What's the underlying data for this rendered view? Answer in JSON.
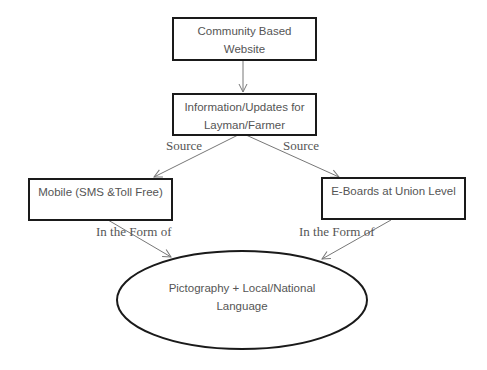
{
  "nodes": {
    "website": {
      "line1": "Community Based",
      "line2": "Website"
    },
    "info": {
      "line1": "Information/Updates for",
      "line2": "Layman/Farmer"
    },
    "mobile": {
      "line1": "Mobile (SMS &Toll Free)"
    },
    "eboards": {
      "line1": "E-Boards at Union Level"
    },
    "pictography": {
      "line1": "Pictography + Local/National",
      "line2": "Language"
    }
  },
  "edges": {
    "source_left": "Source",
    "source_right": "Source",
    "form_left": "In the Form of",
    "form_right": "In the Form of"
  },
  "colors": {
    "stroke": "#1a1a1a",
    "arrow": "#777777",
    "text": "#555555"
  }
}
